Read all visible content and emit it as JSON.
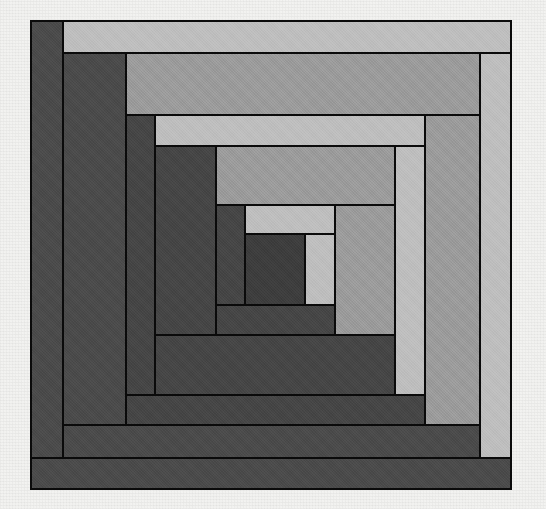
{
  "canvas": {
    "width": 546,
    "height": 509,
    "background_color": "#f2f2f0",
    "description": "Log Cabin quilt block pattern"
  },
  "palette": {
    "light": "#bdbdbd",
    "light_mid": "#b2b2b2",
    "medium": "#9a9a9a",
    "medium_dark": "#8f8f8f",
    "dark": "#4a4a4a",
    "darker": "#3d3d3d",
    "darkest": "#363636",
    "outline": "#0a0a0a"
  },
  "block": {
    "name": "log-cabin-block",
    "origin_x": 31,
    "origin_y": 21,
    "width": 480,
    "height": 468,
    "outline_width": 2.2,
    "tone_count": 3
  },
  "chart_data": {
    "type": "table",
    "xlabel": "",
    "ylabel": "",
    "columns": [
      "log",
      "tone",
      "x",
      "y",
      "w",
      "h",
      "color"
    ],
    "logs": [
      {
        "log": "outer-bottom",
        "tone": "dark",
        "x": 31,
        "y": 458,
        "w": 480,
        "h": 31,
        "color": "#4a4a4a"
      },
      {
        "log": "outer-left",
        "tone": "dark",
        "x": 31,
        "y": 21,
        "w": 32,
        "h": 437,
        "color": "#4a4a4a"
      },
      {
        "log": "outer-top",
        "tone": "light",
        "x": 63,
        "y": 21,
        "w": 448,
        "h": 32,
        "color": "#bdbdbd"
      },
      {
        "log": "outer-right",
        "tone": "light",
        "x": 480,
        "y": 53,
        "w": 31,
        "h": 405,
        "color": "#bdbdbd"
      },
      {
        "log": "r2-bottom",
        "tone": "dark",
        "x": 63,
        "y": 425,
        "w": 417,
        "h": 33,
        "color": "#4a4a4a"
      },
      {
        "log": "r2-left",
        "tone": "dark",
        "x": 63,
        "y": 53,
        "w": 63,
        "h": 372,
        "color": "#4a4a4a"
      },
      {
        "log": "r2-top",
        "tone": "medium",
        "x": 126,
        "y": 53,
        "w": 354,
        "h": 62,
        "color": "#9a9a9a"
      },
      {
        "log": "r2-right",
        "tone": "medium",
        "x": 425,
        "y": 115,
        "w": 55,
        "h": 310,
        "color": "#9a9a9a"
      },
      {
        "log": "r3-bottom",
        "tone": "darker",
        "x": 126,
        "y": 395,
        "w": 299,
        "h": 30,
        "color": "#454545"
      },
      {
        "log": "r3-left",
        "tone": "darker",
        "x": 126,
        "y": 115,
        "w": 29,
        "h": 280,
        "color": "#454545"
      },
      {
        "log": "r3-top",
        "tone": "light",
        "x": 155,
        "y": 115,
        "w": 270,
        "h": 31,
        "color": "#bdbdbd"
      },
      {
        "log": "r3-right",
        "tone": "light",
        "x": 395,
        "y": 146,
        "w": 30,
        "h": 249,
        "color": "#bdbdbd"
      },
      {
        "log": "r4-bottom",
        "tone": "darker",
        "x": 155,
        "y": 335,
        "w": 240,
        "h": 60,
        "color": "#454545"
      },
      {
        "log": "r4-left",
        "tone": "darker",
        "x": 155,
        "y": 146,
        "w": 61,
        "h": 189,
        "color": "#454545"
      },
      {
        "log": "r4-top",
        "tone": "medium",
        "x": 216,
        "y": 146,
        "w": 179,
        "h": 59,
        "color": "#9a9a9a"
      },
      {
        "log": "r4-right",
        "tone": "medium",
        "x": 335,
        "y": 205,
        "w": 60,
        "h": 130,
        "color": "#9a9a9a"
      },
      {
        "log": "r5-bottom",
        "tone": "darker",
        "x": 216,
        "y": 305,
        "w": 119,
        "h": 30,
        "color": "#454545"
      },
      {
        "log": "r5-left",
        "tone": "darker",
        "x": 216,
        "y": 205,
        "w": 29,
        "h": 100,
        "color": "#454545"
      },
      {
        "log": "r5-top",
        "tone": "light",
        "x": 245,
        "y": 205,
        "w": 90,
        "h": 29,
        "color": "#bdbdbd"
      },
      {
        "log": "center-right",
        "tone": "light",
        "x": 305,
        "y": 234,
        "w": 30,
        "h": 71,
        "color": "#bdbdbd"
      },
      {
        "log": "center-square",
        "tone": "darkest",
        "x": 245,
        "y": 234,
        "w": 60,
        "h": 71,
        "color": "#3d3d3d"
      }
    ]
  }
}
